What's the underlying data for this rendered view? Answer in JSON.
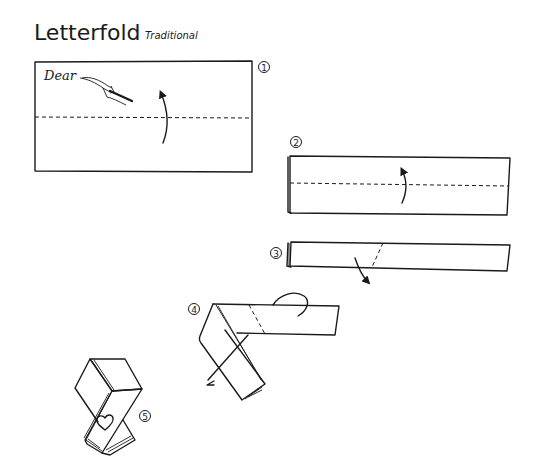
{
  "header": {
    "title": "Letterfold",
    "subtitle": "Traditional"
  },
  "steps": [
    {
      "number": "1",
      "description": "Sheet with writing; valley fold bottom half up along dashed line",
      "handwriting": "Dear"
    },
    {
      "number": "2",
      "description": "Folded strip; valley fold up along dashed line"
    },
    {
      "number": "3",
      "description": "Narrow strip; fold down diagonally along dashed line"
    },
    {
      "number": "4",
      "description": "Diagonal strip; fold behind along dashed line"
    },
    {
      "number": "5",
      "description": "Finished letterfold with heart",
      "decoration": "heart"
    }
  ],
  "colors": {
    "ink": "#1a1a1a",
    "paper": "#ffffff"
  }
}
